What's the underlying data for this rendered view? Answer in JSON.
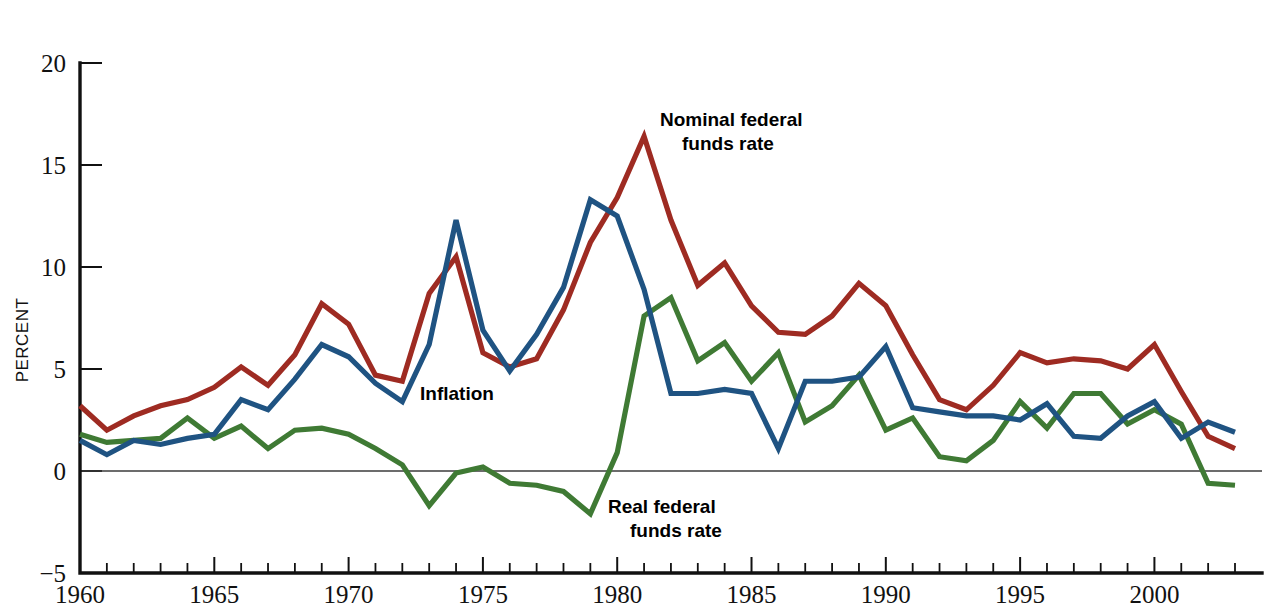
{
  "chart_data": {
    "type": "line",
    "title": "",
    "xlabel": "",
    "ylabel": "PERCENT",
    "xlim": [
      1960,
      2003
    ],
    "ylim": [
      -5,
      20
    ],
    "yticks": [
      -5,
      0,
      5,
      10,
      15,
      20
    ],
    "ytick_labels": [
      "−5",
      "0",
      "5",
      "10",
      "15",
      "20"
    ],
    "xticks_major": [
      1960,
      1965,
      1970,
      1975,
      1980,
      1985,
      1990,
      1995,
      2000
    ],
    "xtick_labels": [
      "1960",
      "1965",
      "1970",
      "1975",
      "1980",
      "1985",
      "1990",
      "1995",
      "2000"
    ],
    "xtick_minor_step": 1,
    "grid": false,
    "zero_line": true,
    "legend_position": "inline-annotations",
    "annotations": [
      {
        "name": "nominal-federal-funds-rate-label",
        "text_line1": "Nominal federal",
        "text_line2": "funds rate",
        "x": 660,
        "y": 126
      },
      {
        "name": "inflation-label",
        "text_line1": "Inflation",
        "text_line2": "",
        "x": 420,
        "y": 400
      },
      {
        "name": "real-federal-funds-rate-label",
        "text_line1": "Real federal",
        "text_line2": "funds rate",
        "x": 608,
        "y": 513
      }
    ],
    "x": [
      1960,
      1961,
      1962,
      1963,
      1964,
      1965,
      1966,
      1967,
      1968,
      1969,
      1970,
      1971,
      1972,
      1973,
      1974,
      1975,
      1976,
      1977,
      1978,
      1979,
      1980,
      1981,
      1982,
      1983,
      1984,
      1985,
      1986,
      1987,
      1988,
      1989,
      1990,
      1991,
      1992,
      1993,
      1994,
      1995,
      1996,
      1997,
      1998,
      1999,
      2000,
      2001,
      2002,
      2003
    ],
    "series": [
      {
        "name": "Nominal federal funds rate",
        "color": "#9E2B22",
        "values": [
          3.2,
          2.0,
          2.7,
          3.2,
          3.5,
          4.1,
          5.1,
          4.2,
          5.7,
          8.2,
          7.2,
          4.7,
          4.4,
          8.7,
          10.5,
          5.8,
          5.1,
          5.5,
          7.9,
          11.2,
          13.4,
          16.4,
          12.3,
          9.1,
          10.2,
          8.1,
          6.8,
          6.7,
          7.6,
          9.2,
          8.1,
          5.7,
          3.5,
          3.0,
          4.2,
          5.8,
          5.3,
          5.5,
          5.4,
          5.0,
          6.2,
          3.9,
          1.7,
          1.1
        ]
      },
      {
        "name": "Inflation",
        "color": "#1F5382",
        "values": [
          1.5,
          0.8,
          1.5,
          1.3,
          1.6,
          1.8,
          3.5,
          3.0,
          4.5,
          6.2,
          5.6,
          4.3,
          3.4,
          6.2,
          12.3,
          6.9,
          4.9,
          6.7,
          9.0,
          13.3,
          12.5,
          8.9,
          3.8,
          3.8,
          4.0,
          3.8,
          1.1,
          4.4,
          4.4,
          4.6,
          6.1,
          3.1,
          2.9,
          2.7,
          2.7,
          2.5,
          3.3,
          1.7,
          1.6,
          2.7,
          3.4,
          1.6,
          2.4,
          1.9
        ]
      },
      {
        "name": "Real federal funds rate",
        "color": "#3F7A34",
        "values": [
          1.8,
          1.4,
          1.5,
          1.6,
          2.6,
          1.6,
          2.2,
          1.1,
          2.0,
          2.1,
          1.8,
          1.1,
          0.3,
          -1.7,
          -0.1,
          0.2,
          -0.6,
          -0.7,
          -1.0,
          -2.1,
          0.9,
          7.6,
          8.5,
          5.4,
          6.3,
          4.4,
          5.8,
          2.4,
          3.2,
          4.7,
          2.0,
          2.6,
          0.7,
          0.5,
          1.5,
          3.4,
          2.1,
          3.8,
          3.8,
          2.3,
          3.0,
          2.3,
          -0.6,
          -0.7
        ]
      }
    ]
  },
  "axis": {
    "y_title": "PERCENT"
  }
}
